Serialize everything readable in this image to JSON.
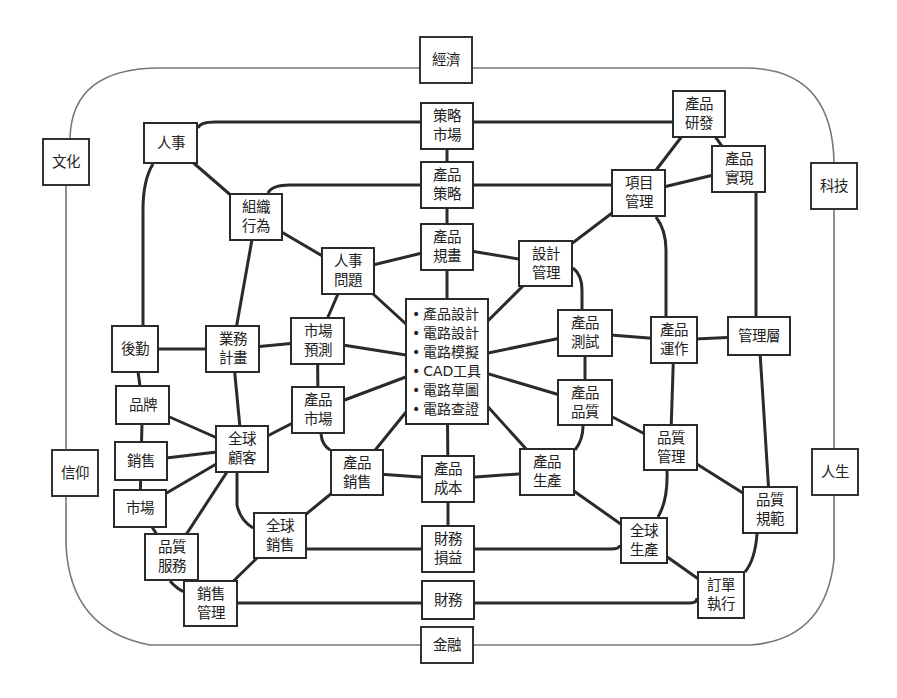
{
  "diagram": {
    "colors": {
      "line": "#2a2a2a",
      "outer_line": "#777777",
      "box_border": "#2a2a2a",
      "text": "#222222",
      "background": "#ffffff"
    },
    "outer_ring": {
      "x": 66,
      "y": 67,
      "w": 768,
      "h": 230,
      "rx": 90
    },
    "outer_nodes": [
      {
        "id": "economy",
        "lines": [
          "經濟"
        ],
        "x": 419,
        "y": 36,
        "w": 54,
        "h": 48
      },
      {
        "id": "culture",
        "lines": [
          "文化"
        ],
        "x": 42,
        "y": 138,
        "w": 48,
        "h": 48
      },
      {
        "id": "technology",
        "lines": [
          "科技"
        ],
        "x": 810,
        "y": 162,
        "w": 48,
        "h": 48
      },
      {
        "id": "belief",
        "lines": [
          "信仰"
        ],
        "x": 51,
        "y": 449,
        "w": 48,
        "h": 48
      },
      {
        "id": "life",
        "lines": [
          "人生"
        ],
        "x": 811,
        "y": 448,
        "w": 48,
        "h": 48
      },
      {
        "id": "finance",
        "lines": [
          "金融"
        ],
        "x": 420,
        "y": 626,
        "w": 54,
        "h": 38
      }
    ],
    "nodes": [
      {
        "id": "strategic-market",
        "lines": [
          "策略",
          "市場"
        ],
        "x": 420,
        "y": 102,
        "w": 54,
        "h": 48
      },
      {
        "id": "hr",
        "lines": [
          "人事"
        ],
        "x": 143,
        "y": 122,
        "w": 55,
        "h": 42
      },
      {
        "id": "rd",
        "lines": [
          "產品",
          "研發"
        ],
        "x": 672,
        "y": 90,
        "w": 54,
        "h": 48
      },
      {
        "id": "product-strategy",
        "lines": [
          "產品",
          "策略"
        ],
        "x": 420,
        "y": 161,
        "w": 54,
        "h": 48
      },
      {
        "id": "realization",
        "lines": [
          "產品",
          "實現"
        ],
        "x": 711,
        "y": 145,
        "w": 55,
        "h": 48
      },
      {
        "id": "project-mgmt",
        "lines": [
          "項目",
          "管理"
        ],
        "x": 611,
        "y": 169,
        "w": 55,
        "h": 48
      },
      {
        "id": "org-behavior",
        "lines": [
          "組織",
          "行為"
        ],
        "x": 229,
        "y": 193,
        "w": 54,
        "h": 48
      },
      {
        "id": "product-planning",
        "lines": [
          "產品",
          "規畫"
        ],
        "x": 420,
        "y": 223,
        "w": 54,
        "h": 48
      },
      {
        "id": "design-mgmt",
        "lines": [
          "設計",
          "管理"
        ],
        "x": 518,
        "y": 240,
        "w": 55,
        "h": 47
      },
      {
        "id": "hr-issues",
        "lines": [
          "人事",
          "問題"
        ],
        "x": 321,
        "y": 247,
        "w": 54,
        "h": 48
      },
      {
        "id": "logistics",
        "lines": [
          "後勤"
        ],
        "x": 111,
        "y": 325,
        "w": 48,
        "h": 48
      },
      {
        "id": "biz-plan",
        "lines": [
          "業務",
          "計畫"
        ],
        "x": 205,
        "y": 325,
        "w": 55,
        "h": 48
      },
      {
        "id": "market-forecast",
        "lines": [
          "市場",
          "預測"
        ],
        "x": 290,
        "y": 317,
        "w": 55,
        "h": 48
      },
      {
        "id": "product-test",
        "lines": [
          "產品",
          "測試"
        ],
        "x": 557,
        "y": 309,
        "w": 56,
        "h": 48
      },
      {
        "id": "product-ops",
        "lines": [
          "產品",
          "運作"
        ],
        "x": 650,
        "y": 316,
        "w": 48,
        "h": 48
      },
      {
        "id": "management",
        "lines": [
          "管理層"
        ],
        "x": 727,
        "y": 316,
        "w": 64,
        "h": 40
      },
      {
        "id": "brand",
        "lines": [
          "品牌"
        ],
        "x": 115,
        "y": 385,
        "w": 55,
        "h": 40
      },
      {
        "id": "product-market",
        "lines": [
          "產品",
          "市場"
        ],
        "x": 291,
        "y": 386,
        "w": 54,
        "h": 48
      },
      {
        "id": "product-quality",
        "lines": [
          "產品",
          "品質"
        ],
        "x": 557,
        "y": 379,
        "w": 56,
        "h": 47
      },
      {
        "id": "global-customer",
        "lines": [
          "全球",
          "顧客"
        ],
        "x": 215,
        "y": 425,
        "w": 54,
        "h": 48
      },
      {
        "id": "quality-mgmt",
        "lines": [
          "品質",
          "管理"
        ],
        "x": 643,
        "y": 424,
        "w": 55,
        "h": 47
      },
      {
        "id": "sales",
        "lines": [
          "銷售"
        ],
        "x": 114,
        "y": 441,
        "w": 54,
        "h": 40
      },
      {
        "id": "product-sales",
        "lines": [
          "產品",
          "銷售"
        ],
        "x": 330,
        "y": 449,
        "w": 54,
        "h": 47
      },
      {
        "id": "product-cost",
        "lines": [
          "產品",
          "成本"
        ],
        "x": 421,
        "y": 455,
        "w": 54,
        "h": 48
      },
      {
        "id": "production",
        "lines": [
          "產品",
          "生產"
        ],
        "x": 519,
        "y": 448,
        "w": 56,
        "h": 48
      },
      {
        "id": "market",
        "lines": [
          "市場"
        ],
        "x": 113,
        "y": 489,
        "w": 54,
        "h": 39
      },
      {
        "id": "quality-spec",
        "lines": [
          "品質",
          "規範"
        ],
        "x": 742,
        "y": 486,
        "w": 56,
        "h": 48
      },
      {
        "id": "global-sales",
        "lines": [
          "全球",
          "銷售"
        ],
        "x": 253,
        "y": 512,
        "w": 54,
        "h": 47
      },
      {
        "id": "finance-pl",
        "lines": [
          "財務",
          "損益"
        ],
        "x": 421,
        "y": 525,
        "w": 54,
        "h": 48
      },
      {
        "id": "global-production",
        "lines": [
          "全球",
          "生產"
        ],
        "x": 620,
        "y": 517,
        "w": 48,
        "h": 47
      },
      {
        "id": "quality-service",
        "lines": [
          "品質",
          "服務"
        ],
        "x": 144,
        "y": 533,
        "w": 55,
        "h": 48
      },
      {
        "id": "sales-mgmt",
        "lines": [
          "銷售",
          "管理"
        ],
        "x": 183,
        "y": 580,
        "w": 55,
        "h": 47
      },
      {
        "id": "finance-dept",
        "lines": [
          "財務"
        ],
        "x": 421,
        "y": 580,
        "w": 54,
        "h": 40
      },
      {
        "id": "order-exec",
        "lines": [
          "訂單",
          "執行"
        ],
        "x": 697,
        "y": 571,
        "w": 48,
        "h": 48
      }
    ],
    "center_node": {
      "id": "design-tools",
      "x": 405,
      "y": 298,
      "w": 84,
      "h": 127,
      "items": [
        "產品設計",
        "電路設計",
        "電路模擬",
        "CAD工具",
        "電路草圖",
        "電路查證"
      ]
    },
    "edges": [
      [
        "strategic-market",
        "product-strategy"
      ],
      [
        "product-strategy",
        "product-planning"
      ],
      [
        "product-planning",
        "design-tools"
      ],
      [
        "design-tools",
        "product-cost"
      ],
      [
        "product-cost",
        "finance-pl"
      ],
      [
        "hr",
        "org-behavior"
      ],
      [
        "org-behavior",
        "hr-issues"
      ],
      [
        "hr-issues",
        "product-planning"
      ],
      [
        "hr-issues",
        "design-tools"
      ],
      [
        "hr-issues",
        "market-forecast"
      ],
      [
        "org-behavior",
        "biz-plan"
      ],
      [
        "logistics",
        "biz-plan"
      ],
      [
        "biz-plan",
        "market-forecast"
      ],
      [
        "market-forecast",
        "design-tools"
      ],
      [
        "market-forecast",
        "product-market"
      ],
      [
        "product-market",
        "design-tools"
      ],
      [
        "product-market",
        "global-customer"
      ],
      [
        "biz-plan",
        "global-customer"
      ],
      [
        "logistics",
        "brand"
      ],
      [
        "brand",
        "sales"
      ],
      [
        "sales",
        "market"
      ],
      [
        "market",
        "quality-service"
      ],
      [
        "brand",
        "global-customer"
      ],
      [
        "sales",
        "global-customer"
      ],
      [
        "market",
        "global-customer"
      ],
      [
        "quality-service",
        "global-customer"
      ],
      [
        "quality-service",
        "sales-mgmt"
      ],
      [
        "sales-mgmt",
        "global-sales"
      ],
      [
        "global-sales",
        "product-sales"
      ],
      [
        "product-sales",
        "design-tools"
      ],
      [
        "product-sales",
        "product-cost"
      ],
      [
        "product-cost",
        "production"
      ],
      [
        "production",
        "design-tools"
      ],
      [
        "production",
        "global-production"
      ],
      [
        "global-production",
        "order-exec"
      ],
      [
        "rd",
        "project-mgmt"
      ],
      [
        "rd",
        "realization"
      ],
      [
        "project-mgmt",
        "realization"
      ],
      [
        "project-mgmt",
        "design-mgmt"
      ],
      [
        "design-mgmt",
        "product-planning"
      ],
      [
        "design-mgmt",
        "design-tools"
      ],
      [
        "design-tools",
        "product-test"
      ],
      [
        "product-test",
        "product-ops"
      ],
      [
        "product-ops",
        "management"
      ],
      [
        "product-test",
        "product-quality"
      ],
      [
        "design-tools",
        "product-quality"
      ],
      [
        "product-quality",
        "quality-mgmt"
      ],
      [
        "quality-mgmt",
        "quality-spec"
      ],
      [
        "product-ops",
        "quality-mgmt"
      ],
      [
        "management",
        "quality-spec"
      ]
    ],
    "polylines": [
      {
        "name": "hr-to-strategic-market",
        "d": "M198,128 Q200,122 215,122 L420,122"
      },
      {
        "name": "strategic-market-to-rd",
        "d": "M474,122 L672,122"
      },
      {
        "name": "org-behavior-to-product-strategy",
        "d": "M268,193 Q272,185 290,185 L420,185"
      },
      {
        "name": "product-strategy-to-project-mgmt",
        "d": "M474,185 L611,185"
      },
      {
        "name": "hr-to-logistics",
        "d": "M153,164 Q143,180 143,210 L143,325"
      },
      {
        "name": "project-mgmt-to-product-ops",
        "d": "M656,217 Q666,230 666,250 L666,316"
      },
      {
        "name": "design-mgmt-to-product-test",
        "d": "M573,268 Q582,275 582,290 L582,309"
      },
      {
        "name": "realization-to-management",
        "d": "M756,193 L756,316"
      },
      {
        "name": "product-market-to-product-sales",
        "d": "M321,434 Q322,445 330,450"
      },
      {
        "name": "global-customer-to-global-sales",
        "d": "M237,473 L237,505 Q240,520 253,528"
      },
      {
        "name": "global-sales-to-finance-pl",
        "d": "M307,549 L421,549"
      },
      {
        "name": "finance-pl-to-global-production",
        "d": "M475,549 L610,549 Q620,549 620,545"
      },
      {
        "name": "sales-mgmt-to-finance-dept",
        "d": "M238,603 L421,603"
      },
      {
        "name": "finance-dept-to-order-exec",
        "d": "M475,603 L690,603 Q697,603 697,598"
      },
      {
        "name": "product-quality-to-production",
        "d": "M583,426 Q583,440 575,450"
      },
      {
        "name": "quality-mgmt-to-global-production",
        "d": "M667,471 Q668,500 658,517"
      },
      {
        "name": "quality-spec-to-order-exec",
        "d": "M757,534 Q755,560 745,572"
      },
      {
        "name": "quality-service-to-sales-mgmt",
        "d": "M170,581 Q178,590 185,592"
      }
    ],
    "outer_polylines": [
      {
        "name": "ring-top-left",
        "d": "M419,68 L160,68 Q72,68 70,138"
      },
      {
        "name": "ring-top-right",
        "d": "M473,68 L745,68 Q832,68 834,162"
      },
      {
        "name": "ring-left",
        "d": "M66,186 L66,449"
      },
      {
        "name": "ring-left-bottom",
        "d": "M66,497 L66,545 Q70,630 150,645 L420,645"
      },
      {
        "name": "ring-right",
        "d": "M834,210 L834,448"
      },
      {
        "name": "ring-right-bottom",
        "d": "M834,496 L834,560 Q825,640 750,645 L474,645"
      }
    ]
  }
}
